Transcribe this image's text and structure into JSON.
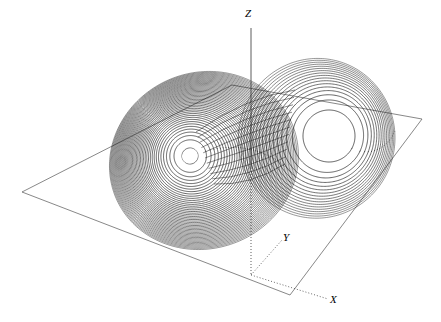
{
  "figure": {
    "title": "",
    "background_color": "#ffffff",
    "stroke_color": "#1a1a1a",
    "width": 441,
    "height": 322
  },
  "axes": {
    "z": {
      "label": "Z",
      "style": "solid-above-plane, dotted-below-plane"
    },
    "y": {
      "label": "Y",
      "style": "dotted"
    },
    "x": {
      "label": "X",
      "style": "dotted"
    },
    "origin_px": [
      251,
      275
    ]
  },
  "plane": {
    "name": "reference-plane",
    "shape": "parallelogram",
    "stroke": "#555555",
    "vertices_px": [
      [
        22,
        192
      ],
      [
        232,
        85
      ],
      [
        422,
        119
      ],
      [
        290,
        295
      ]
    ]
  },
  "chart_data": {
    "type": "line",
    "subtitle": "Butterfly-shaped trajectory in 3-D phase space with reference plane",
    "xlabel": "X",
    "ylabel": "Y",
    "zlabel": "Z",
    "grid": false,
    "legend": null,
    "annotations": [
      "Z",
      "Y",
      "X"
    ],
    "series": [
      {
        "name": "trajectory-left-lobe",
        "description": "Dense inward spiral, ~46 windings converging to a white focal eye",
        "center_px": [
          190,
          156
        ],
        "eye_radius_px": 8,
        "windings": 46,
        "outer_radius_px": [
          95,
          97
        ],
        "rotation_deg": -18,
        "line_style_above_plane": "solid",
        "line_style_below_plane": "dotted"
      },
      {
        "name": "trajectory-right-lobe",
        "description": "Sparse outward spiral, ~17 windings around a large empty focus",
        "center_px": [
          329,
          136
        ],
        "eye_radius_px": 26,
        "windings": 17,
        "outer_radius_px": [
          78,
          88
        ],
        "rotation_deg": 28,
        "line_style_above_plane": "solid",
        "line_style_below_plane": "dotted"
      },
      {
        "name": "transition-bundle",
        "description": "Crossing strands carrying the orbit between the two lobes",
        "strand_count": 11
      }
    ],
    "xlim": [
      -20,
      20
    ],
    "ylim": [
      -25,
      25
    ],
    "zlim": [
      0,
      50
    ]
  }
}
